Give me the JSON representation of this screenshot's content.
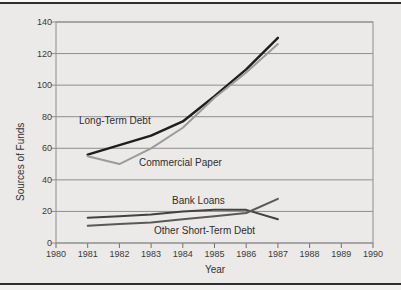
{
  "page": {
    "background": "#ebeae8",
    "rule_color": "#2f2f2f"
  },
  "chart_data": {
    "type": "line",
    "title": "",
    "xlabel": "Year",
    "ylabel": "Sources of Funds",
    "xlim": [
      1980,
      1990
    ],
    "ylim": [
      0,
      140
    ],
    "x_ticks": [
      1980,
      1981,
      1982,
      1983,
      1984,
      1985,
      1986,
      1987,
      1988,
      1989,
      1990
    ],
    "y_ticks": [
      0,
      20,
      40,
      60,
      80,
      100,
      120,
      140
    ],
    "grid": "horizontal",
    "legend_position": "inline-labels",
    "axis_color": "#8e8e8e",
    "tick_color": "#6f6f6f",
    "x": [
      1981,
      1982,
      1983,
      1984,
      1985,
      1986,
      1987
    ],
    "series": [
      {
        "name": "Long-Term Debt",
        "values": [
          56,
          62,
          68,
          77,
          93,
          110,
          130
        ],
        "color": "#1e1e1e",
        "stroke_width": 2.4
      },
      {
        "name": "Commercial Paper",
        "values": [
          55,
          50,
          60,
          73,
          92,
          108,
          126
        ],
        "color": "#9b9b9b",
        "stroke_width": 2
      },
      {
        "name": "Bank Loans",
        "values": [
          16,
          17,
          18,
          20,
          21,
          21,
          15
        ],
        "color": "#424242",
        "stroke_width": 2
      },
      {
        "name": "Other Short-Term Debt",
        "values": [
          11,
          12,
          13,
          15,
          17,
          19,
          28
        ],
        "color": "#595959",
        "stroke_width": 2
      }
    ]
  }
}
